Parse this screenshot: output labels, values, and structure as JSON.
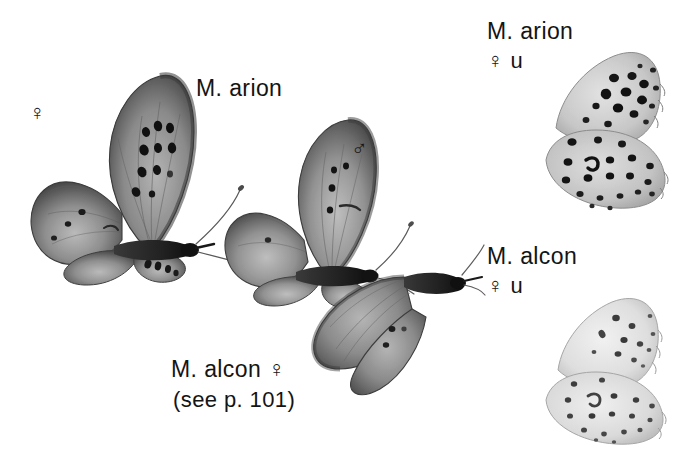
{
  "plate": {
    "background_color": "#ffffff",
    "ink_color": "#141414",
    "width": 695,
    "height": 455,
    "description": "Monochrome field-guide plate of Maculinea (large blue) butterflies: two upperside specimens at left, one partly hidden upperside specimen, and two underside specimens at right."
  },
  "labels": {
    "arion_upperside": "M. arion",
    "alcon_upperside": "M. alcon ♀",
    "alcon_reference": "(see p. 101)",
    "arion_underside_name": "M. arion",
    "arion_underside_sex": "♀ u",
    "alcon_underside_name": "M. alcon",
    "alcon_underside_sex": "♀ u"
  },
  "symbols": {
    "female": "♀",
    "male": "♂",
    "underside_code": "u"
  },
  "specimens": [
    {
      "id": "arion-female-upperside",
      "species": "M. arion",
      "sex": "♀",
      "view": "upperside",
      "position": "left",
      "notes": "Dark greyish forewing with a bold arc of black discal spots and a dark outer border."
    },
    {
      "id": "arion-male-upperside",
      "species": "M. arion",
      "sex": "♂",
      "view": "upperside",
      "position": "centre",
      "notes": "Paler than the female with fewer, smaller black discal spots."
    },
    {
      "id": "alcon-female-upperside",
      "species": "M. alcon",
      "sex": "♀",
      "view": "upperside",
      "position": "centre-lower",
      "notes": "Overlaps and is partly hidden behind the arion male; see p. 101."
    },
    {
      "id": "arion-female-underside",
      "species": "M. arion",
      "sex": "♀",
      "view": "underside",
      "position": "upper right",
      "notes": "Pale grey ground heavily marked with large, strongly black ringed spots."
    },
    {
      "id": "alcon-female-underside",
      "species": "M. alcon",
      "sex": "♀",
      "view": "underside",
      "position": "lower right",
      "notes": "Paler, whiter ground with much smaller and fainter grey-black spots."
    }
  ]
}
